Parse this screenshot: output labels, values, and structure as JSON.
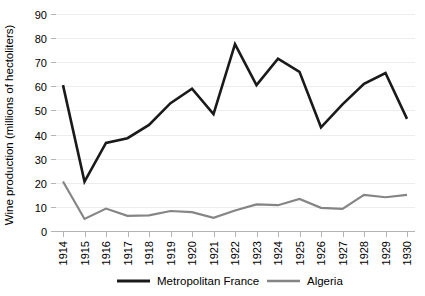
{
  "chart_data": {
    "type": "line",
    "title": "",
    "subtitle": "",
    "xlabel": "",
    "ylabel": "Wine production (millions of hectoliters)",
    "categories": [
      "1914",
      "1915",
      "1916",
      "1917",
      "1918",
      "1919",
      "1920",
      "1921",
      "1922",
      "1923",
      "1924",
      "1925",
      "1926",
      "1927",
      "1928",
      "1929",
      "1930"
    ],
    "ylim": [
      0,
      90
    ],
    "ytick_step": 10,
    "yticks": [
      "0",
      "10",
      "20",
      "30",
      "40",
      "50",
      "60",
      "70",
      "80",
      "90"
    ],
    "grid": "horizontal",
    "legend_position": "bottom",
    "xtick_rotation": -90,
    "series": [
      {
        "name": "Metropolitan France",
        "color": "#1a1a1a",
        "stroke_width": 2.6,
        "values": [
          60.5,
          20.5,
          36.5,
          38.5,
          44.0,
          53.0,
          59.0,
          48.5,
          77.5,
          60.5,
          71.5,
          66.0,
          43.0,
          52.5,
          61.0,
          65.5,
          46.5
        ]
      },
      {
        "name": "Algeria",
        "color": "#858585",
        "stroke_width": 2.2,
        "values": [
          20.5,
          5.0,
          9.3,
          6.3,
          6.5,
          8.3,
          7.8,
          5.5,
          8.5,
          11.0,
          10.7,
          13.3,
          9.6,
          9.2,
          15.0,
          14.0,
          15.0
        ]
      }
    ]
  },
  "legend": {
    "items": [
      {
        "label": "Metropolitan France",
        "color": "#1a1a1a"
      },
      {
        "label": "Algeria",
        "color": "#858585"
      }
    ]
  },
  "colors": {
    "background": "#ffffff",
    "gridline": "#ededed",
    "axis": "#b4b4b4",
    "text": "#000000",
    "series_france": "#1a1a1a",
    "series_algeria": "#858585"
  }
}
